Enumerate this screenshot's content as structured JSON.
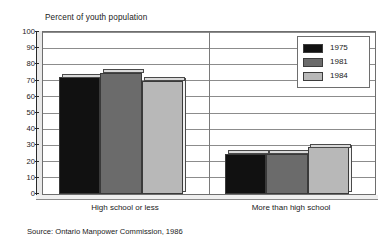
{
  "chart_data": {
    "type": "bar",
    "title": "Percent of youth population",
    "xlabel": "",
    "ylabel": "",
    "ylim": [
      0,
      100
    ],
    "ytick_step": 10,
    "yticks": [
      0,
      10,
      20,
      30,
      40,
      50,
      60,
      70,
      80,
      90,
      100
    ],
    "grid": true,
    "legend_position": "top-right",
    "categories": [
      "High school or less",
      "More than high school"
    ],
    "series": [
      {
        "name": "1975",
        "color": "#111111",
        "values": [
          72,
          25
        ]
      },
      {
        "name": "1981",
        "color": "#6b6b6b",
        "values": [
          75,
          25
        ]
      },
      {
        "name": "1984",
        "color": "#b8b8b8",
        "values": [
          70,
          29
        ]
      }
    ],
    "source": "Source: Ontario Manpower Commission, 1986"
  },
  "labels": {
    "title": "Percent of youth population",
    "source": "Source: Ontario Manpower Commission, 1986",
    "category_0": "High school or less",
    "category_1": "More than high school",
    "legend_0": "1975",
    "legend_1": "1981",
    "legend_2": "1984",
    "ytick_0": "0",
    "ytick_1": "10",
    "ytick_2": "20",
    "ytick_3": "30",
    "ytick_4": "40",
    "ytick_5": "50",
    "ytick_6": "60",
    "ytick_7": "70",
    "ytick_8": "80",
    "ytick_9": "90",
    "ytick_10": "100"
  }
}
